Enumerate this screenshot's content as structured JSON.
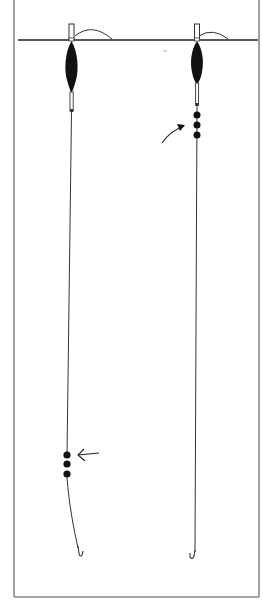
{
  "diagram": {
    "type": "fishing-float-rig-comparison",
    "colors": {
      "frame": "#8a8a8a",
      "line": "#333333",
      "float_body": "#111111",
      "water_line": "#222222",
      "background": "#ffffff"
    },
    "water_line_y": 40,
    "rigs": [
      {
        "id": "left-rig",
        "description": "Shot placed low on line, near hook",
        "float_x": 71,
        "shot_count": 3,
        "shot_y": [
          456,
          466,
          476
        ],
        "arrow_points": "left, toward shot"
      },
      {
        "id": "right-rig",
        "description": "Shot placed high on line, just below float",
        "float_x": 197,
        "shot_count": 3,
        "shot_y": [
          114,
          124,
          134
        ],
        "arrow_points": "up-right, toward shot"
      }
    ]
  }
}
